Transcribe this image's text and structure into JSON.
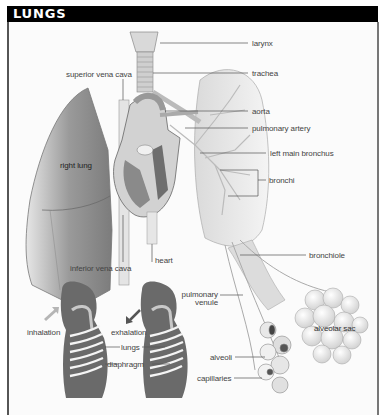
{
  "title": "LUNGS",
  "colors": {
    "title_bar": "#000000",
    "title_text": "#ffffff",
    "label_text": "#444444",
    "leader_line": "#555555"
  },
  "labels": {
    "larynx": "larynx",
    "trachea": "trachea",
    "superior_vena_cava": "superior vena cava",
    "aorta": "aorta",
    "pulmonary_artery": "pulmonary artery",
    "left_main_bronchus": "left main bronchus",
    "right_lung": "right lung",
    "bronchi": "bronchi",
    "inferior_vena_cava": "inferior vena cava",
    "heart": "heart",
    "bronchiole": "bronchiole",
    "pulmonary_venule_line1": "pulmonary",
    "pulmonary_venule_line2": "venule",
    "alveolar_sac": "alveolar sac",
    "inhalation": "inhalation",
    "exhalation": "exhalation",
    "lungs": "lungs",
    "diaphragm": "diaphragm",
    "alveoli": "alveoli",
    "capillaries": "capillaries"
  }
}
